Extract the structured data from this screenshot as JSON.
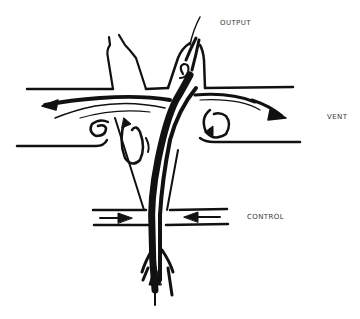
{
  "diagram": {
    "type": "fluidic amplifier flow schematic",
    "labels": {
      "output": "OUTPUT",
      "vent": "VENT",
      "control": "CONTROL"
    },
    "colors": {
      "ink": "#111111",
      "background": "#ffffff",
      "label_text": "#3a3a3a"
    },
    "elements": [
      "output channel (right, with swirling flow)",
      "second upper channel (left, empty)",
      "main horizontal vent channel with flow arrows to left and right",
      "vortex eddies in vent channel",
      "tapered interaction chamber",
      "control ports with opposing inward arrows",
      "supply jet entering from bottom with upward arrow"
    ]
  }
}
